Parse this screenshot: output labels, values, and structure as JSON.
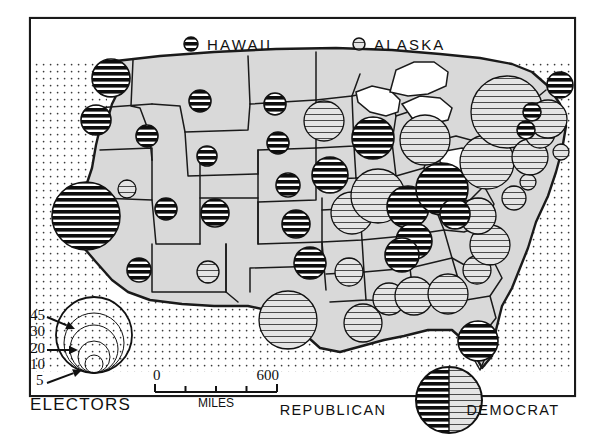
{
  "figure": {
    "kind": "proportional-symbol-map",
    "frame_color": "#1a1a1a",
    "land_color": "#d9d9d9",
    "ocean_pattern": "dot-grid",
    "republican_color": "#111111",
    "democrat_color": "#9a9a9a"
  },
  "inset_labels": [
    {
      "name": "hawaii",
      "text": "HAWAII",
      "party": "republican",
      "electors": 4,
      "x": 191,
      "y": 44,
      "r": 7
    },
    {
      "name": "alaska",
      "text": "ALASKA",
      "party": "democrat",
      "electors": 3,
      "x": 359,
      "y": 44,
      "r": 6
    }
  ],
  "legend_electors": {
    "title": "ELECTORS",
    "title_x": 30,
    "title_y": 410,
    "center_x": 94,
    "baseline_y": 373,
    "rings": [
      {
        "value": "45",
        "r": 38,
        "label_x": 30,
        "label_y": 320,
        "arrow_from_x": 47,
        "arrow_from_y": 317,
        "arrow_to_x": 75,
        "arrow_to_y": 329
      },
      {
        "value": "30",
        "r": 30,
        "label_x": 30,
        "label_y": 336,
        "arrow_from_x": 0,
        "arrow_from_y": 0,
        "arrow_to_x": 0,
        "arrow_to_y": 0
      },
      {
        "value": "20",
        "r": 24,
        "label_x": 30,
        "label_y": 353,
        "arrow_from_x": 47,
        "arrow_from_y": 350,
        "arrow_to_x": 78,
        "arrow_to_y": 350
      },
      {
        "value": "10",
        "r": 16,
        "label_x": 30,
        "label_y": 369,
        "arrow_from_x": 0,
        "arrow_from_y": 0,
        "arrow_to_x": 0,
        "arrow_to_y": 0
      },
      {
        "value": "5",
        "r": 9,
        "label_x": 36,
        "label_y": 385,
        "arrow_from_x": 47,
        "arrow_from_y": 383,
        "arrow_to_x": 82,
        "arrow_to_y": 370
      }
    ]
  },
  "legend_scale": {
    "unit_label": "MILES",
    "min_label": "0",
    "max_label": "600",
    "x1": 155,
    "x2": 277,
    "y": 392,
    "ticks": 4
  },
  "legend_party": {
    "republican_label": "REPUBLICAN",
    "democrat_label": "DEMOCRAT",
    "republican_label_x": 333,
    "democrat_label_x": 513,
    "label_y": 415,
    "key_x": 449,
    "key_y": 400,
    "key_r": 33
  },
  "chart_data": {
    "type": "map",
    "title": "ELECTORS",
    "legend": [
      "REPUBLICAN",
      "DEMOCRAT"
    ],
    "symbol_scale": {
      "values": [
        5,
        10,
        20,
        30,
        45
      ],
      "radii_px": [
        9,
        16,
        24,
        30,
        38
      ]
    },
    "states": [
      {
        "code": "WA",
        "name": "Washington",
        "electors": 9,
        "party": "republican",
        "x": 111,
        "y": 78,
        "r": 19
      },
      {
        "code": "OR",
        "name": "Oregon",
        "electors": 6,
        "party": "republican",
        "x": 96,
        "y": 120,
        "r": 15
      },
      {
        "code": "CA",
        "name": "California",
        "electors": 40,
        "party": "republican",
        "x": 86,
        "y": 216,
        "r": 34
      },
      {
        "code": "ID",
        "name": "Idaho",
        "electors": 4,
        "party": "republican",
        "x": 147,
        "y": 136,
        "r": 11
      },
      {
        "code": "NV",
        "name": "Nevada",
        "electors": 3,
        "party": "democrat",
        "x": 127,
        "y": 189,
        "r": 9
      },
      {
        "code": "MT",
        "name": "Montana",
        "electors": 4,
        "party": "republican",
        "x": 200,
        "y": 101,
        "r": 11
      },
      {
        "code": "WY",
        "name": "Wyoming",
        "electors": 3,
        "party": "republican",
        "x": 207,
        "y": 156,
        "r": 10
      },
      {
        "code": "UT",
        "name": "Utah",
        "electors": 4,
        "party": "republican",
        "x": 166,
        "y": 209,
        "r": 11
      },
      {
        "code": "AZ",
        "name": "Arizona",
        "electors": 5,
        "party": "republican",
        "x": 139,
        "y": 270,
        "r": 12
      },
      {
        "code": "CO",
        "name": "Colorado",
        "electors": 6,
        "party": "republican",
        "x": 215,
        "y": 213,
        "r": 14
      },
      {
        "code": "NM",
        "name": "New Mexico",
        "electors": 4,
        "party": "democrat",
        "x": 208,
        "y": 272,
        "r": 11
      },
      {
        "code": "ND",
        "name": "North Dakota",
        "electors": 4,
        "party": "republican",
        "x": 275,
        "y": 104,
        "r": 11
      },
      {
        "code": "SD",
        "name": "South Dakota",
        "electors": 4,
        "party": "republican",
        "x": 278,
        "y": 143,
        "r": 11
      },
      {
        "code": "NE",
        "name": "Nebraska",
        "electors": 5,
        "party": "republican",
        "x": 288,
        "y": 185,
        "r": 12
      },
      {
        "code": "KS",
        "name": "Kansas",
        "electors": 7,
        "party": "republican",
        "x": 296,
        "y": 224,
        "r": 14
      },
      {
        "code": "OK",
        "name": "Oklahoma",
        "electors": 8,
        "party": "republican",
        "x": 310,
        "y": 263,
        "r": 16
      },
      {
        "code": "TX",
        "name": "Texas",
        "electors": 25,
        "party": "democrat",
        "x": 288,
        "y": 320,
        "r": 29
      },
      {
        "code": "MN",
        "name": "Minnesota",
        "electors": 10,
        "party": "democrat",
        "x": 324,
        "y": 121,
        "r": 20
      },
      {
        "code": "IA",
        "name": "Iowa",
        "electors": 9,
        "party": "republican",
        "x": 330,
        "y": 175,
        "r": 18
      },
      {
        "code": "MO",
        "name": "Missouri",
        "electors": 12,
        "party": "democrat",
        "x": 352,
        "y": 213,
        "r": 21
      },
      {
        "code": "AR",
        "name": "Arkansas",
        "electors": 6,
        "party": "democrat",
        "x": 349,
        "y": 272,
        "r": 14
      },
      {
        "code": "LA",
        "name": "Louisiana",
        "electors": 10,
        "party": "democrat",
        "x": 363,
        "y": 323,
        "r": 19
      },
      {
        "code": "WI",
        "name": "Wisconsin",
        "electors": 12,
        "party": "republican",
        "x": 373,
        "y": 138,
        "r": 21
      },
      {
        "code": "IL",
        "name": "Illinois",
        "electors": 27,
        "party": "democrat",
        "x": 378,
        "y": 196,
        "r": 27
      },
      {
        "code": "MI",
        "name": "Michigan",
        "electors": 20,
        "party": "democrat",
        "x": 425,
        "y": 140,
        "r": 25
      },
      {
        "code": "IN",
        "name": "Indiana",
        "electors": 13,
        "party": "republican",
        "x": 408,
        "y": 207,
        "r": 21
      },
      {
        "code": "OH",
        "name": "Ohio",
        "electors": 25,
        "party": "republican",
        "x": 442,
        "y": 189,
        "r": 26
      },
      {
        "code": "KY",
        "name": "Kentucky",
        "electors": 10,
        "party": "republican",
        "x": 414,
        "y": 241,
        "r": 18
      },
      {
        "code": "TN",
        "name": "Tennessee",
        "electors": 11,
        "party": "republican",
        "x": 402,
        "y": 255,
        "r": 17
      },
      {
        "code": "MS",
        "name": "Mississippi",
        "electors": 8,
        "party": "democrat",
        "x": 389,
        "y": 299,
        "r": 16
      },
      {
        "code": "AL",
        "name": "Alabama",
        "electors": 11,
        "party": "democrat",
        "x": 414,
        "y": 296,
        "r": 19
      },
      {
        "code": "GA",
        "name": "Georgia",
        "electors": 12,
        "party": "democrat",
        "x": 448,
        "y": 294,
        "r": 20
      },
      {
        "code": "FL",
        "name": "Florida",
        "electors": 10,
        "party": "republican",
        "x": 478,
        "y": 341,
        "r": 20
      },
      {
        "code": "SC",
        "name": "South Carolina",
        "electors": 8,
        "party": "democrat",
        "x": 477,
        "y": 270,
        "r": 14
      },
      {
        "code": "NC",
        "name": "North Carolina",
        "electors": 14,
        "party": "democrat",
        "x": 490,
        "y": 245,
        "r": 20
      },
      {
        "code": "VA",
        "name": "Virginia",
        "electors": 12,
        "party": "democrat",
        "x": 478,
        "y": 216,
        "r": 18
      },
      {
        "code": "WV",
        "name": "West Virginia",
        "electors": 8,
        "party": "republican",
        "x": 455,
        "y": 214,
        "r": 15
      },
      {
        "code": "PA",
        "name": "Pennsylvania",
        "electors": 32,
        "party": "democrat",
        "x": 487,
        "y": 162,
        "r": 27
      },
      {
        "code": "NY",
        "name": "New York",
        "electors": 45,
        "party": "democrat",
        "x": 507,
        "y": 112,
        "r": 36
      },
      {
        "code": "MD",
        "name": "Maryland",
        "electors": 9,
        "party": "democrat",
        "x": 514,
        "y": 198,
        "r": 12
      },
      {
        "code": "DE",
        "name": "Delaware",
        "electors": 3,
        "party": "democrat",
        "x": 528,
        "y": 182,
        "r": 8
      },
      {
        "code": "NJ",
        "name": "New Jersey",
        "electors": 16,
        "party": "democrat",
        "x": 530,
        "y": 157,
        "r": 18
      },
      {
        "code": "CT",
        "name": "Connecticut",
        "electors": 8,
        "party": "democrat",
        "x": 540,
        "y": 133,
        "r": 15
      },
      {
        "code": "RI",
        "name": "Rhode Island",
        "electors": 4,
        "party": "democrat",
        "x": 561,
        "y": 152,
        "r": 8
      },
      {
        "code": "MA",
        "name": "Massachusetts",
        "electors": 16,
        "party": "democrat",
        "x": 548,
        "y": 119,
        "r": 19
      },
      {
        "code": "VT",
        "name": "Vermont",
        "electors": 3,
        "party": "republican",
        "x": 526,
        "y": 130,
        "r": 9
      },
      {
        "code": "NH",
        "name": "New Hampshire",
        "electors": 4,
        "party": "republican",
        "x": 532,
        "y": 112,
        "r": 9
      },
      {
        "code": "ME",
        "name": "Maine",
        "electors": 5,
        "party": "republican",
        "x": 560,
        "y": 85,
        "r": 13
      }
    ]
  }
}
